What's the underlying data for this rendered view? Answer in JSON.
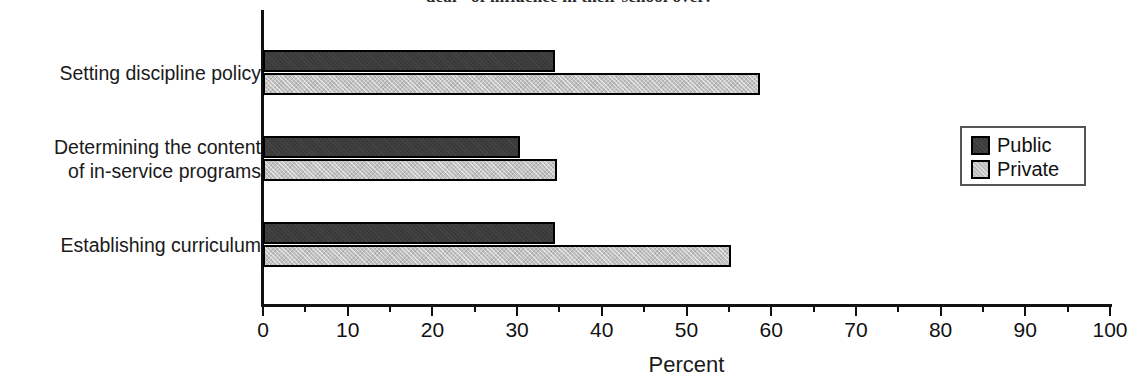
{
  "chart_data": {
    "type": "bar",
    "orientation": "horizontal",
    "title": "deal\" of influence in their school over:",
    "xlabel": "Percent",
    "ylabel": "",
    "xlim": [
      0,
      100
    ],
    "grid": false,
    "legend_position": "right",
    "tick_labels": [
      "0",
      "10",
      "20",
      "30",
      "40",
      "50",
      "60",
      "70",
      "80",
      "90",
      "100"
    ],
    "tick_values": [
      0,
      10,
      20,
      30,
      40,
      50,
      60,
      70,
      80,
      90,
      100
    ],
    "minor_tick_values": [
      5,
      15,
      25,
      35,
      45,
      55,
      65,
      75,
      85,
      95
    ],
    "categories": [
      "Setting discipline policy",
      "Determining the content of in-service programs",
      "Establishing curriculum"
    ],
    "category_lines": [
      [
        "Setting discipline policy"
      ],
      [
        "Determining the content",
        "of in-service programs"
      ],
      [
        "Establishing curriculum"
      ]
    ],
    "series": [
      {
        "name": "Public",
        "color": "#3a3a3a",
        "values": [
          34.5,
          30.3,
          34.5
        ]
      },
      {
        "name": "Private",
        "color": "#c2c2c2",
        "values": [
          58.7,
          34.7,
          55.2
        ]
      }
    ]
  },
  "legend": {
    "items": [
      {
        "label": "Public"
      },
      {
        "label": "Private"
      }
    ]
  }
}
